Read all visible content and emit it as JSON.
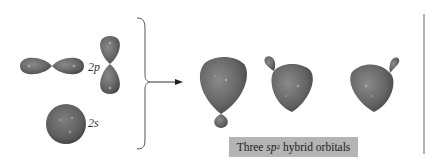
{
  "figure": {
    "type": "orbital hybridization diagram",
    "input_orbitals": [
      {
        "label_main": "2",
        "label_italic": "p",
        "shape": "dumbbell",
        "count": 2,
        "orientations": [
          "horizontal",
          "vertical"
        ]
      },
      {
        "label_main": "2",
        "label_italic": "s",
        "shape": "sphere",
        "count": 1
      }
    ],
    "arrow": "brace-to-arrow",
    "output": {
      "caption_prefix": "Three ",
      "caption_italic": "sp",
      "caption_sup": "2",
      "caption_suffix": " hybrid orbitals",
      "count": 3,
      "orientations": [
        "down",
        "upper-left",
        "upper-right"
      ]
    },
    "colors": {
      "orbital_fill": "#6a6a6a",
      "orbital_dark": "#444444",
      "caption_bg": "#b4b4b4",
      "lines": "#555555"
    }
  }
}
